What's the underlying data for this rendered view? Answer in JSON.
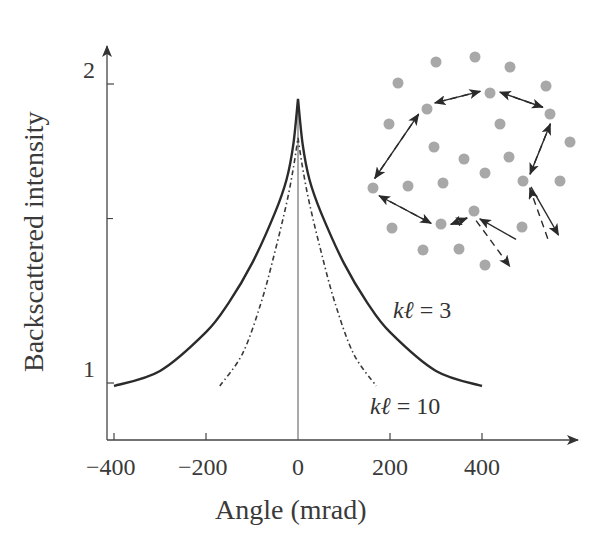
{
  "chart_data": {
    "type": "line",
    "title": "",
    "xlabel": "Angle (mrad)",
    "ylabel": "Backscattered intensity",
    "x_ticks": [
      "−400",
      "−200",
      "0",
      "200",
      "400"
    ],
    "x_tick_values": [
      -400,
      -200,
      0,
      200,
      400
    ],
    "y_ticks": [
      "1",
      "2"
    ],
    "y_tick_values": [
      1,
      2
    ],
    "y_minor_tick_values": [
      1.55
    ],
    "xlim": [
      -420,
      600
    ],
    "ylim": [
      0.8,
      2.15
    ],
    "grid": false,
    "legend_position": "inline labels",
    "series": [
      {
        "name": "kℓ = 3",
        "label_k": "kℓ",
        "label_value": "= 3",
        "style": "solid",
        "color": "#2b2b2b",
        "x": [
          -400,
          -300,
          -200,
          -150,
          -100,
          -50,
          -25,
          -10,
          0,
          10,
          25,
          50,
          100,
          150,
          200,
          300,
          400
        ],
        "y": [
          0.99,
          1.04,
          1.17,
          1.27,
          1.4,
          1.57,
          1.68,
          1.8,
          1.95,
          1.8,
          1.68,
          1.57,
          1.4,
          1.27,
          1.17,
          1.04,
          0.99
        ]
      },
      {
        "name": "kℓ = 10",
        "label_k": "kℓ",
        "label_value": "= 10",
        "style": "dash-dot",
        "color": "#3a3a3a",
        "x": [
          -170,
          -120,
          -80,
          -50,
          -25,
          -10,
          0,
          10,
          25,
          50,
          80,
          120,
          170
        ],
        "y": [
          0.99,
          1.1,
          1.27,
          1.44,
          1.6,
          1.72,
          1.82,
          1.72,
          1.6,
          1.44,
          1.27,
          1.1,
          0.99
        ]
      }
    ],
    "annotations": [
      {
        "text": "kℓ = 3",
        "near_x": 350,
        "near_y": 1.2
      },
      {
        "text": "kℓ = 10",
        "near_x": 300,
        "near_y": 0.92
      }
    ],
    "inset": {
      "description": "Random walk of light among scatterers: forward path (solid arrows) and time-reversed path (dashed arrows)",
      "scatterer_color": "#a8a8a8",
      "scatterers": [
        [
          436,
          62
        ],
        [
          475,
          57
        ],
        [
          510,
          67
        ],
        [
          398,
          83
        ],
        [
          546,
          86
        ],
        [
          490,
          93
        ],
        [
          427,
          109
        ],
        [
          550,
          114
        ],
        [
          389,
          124
        ],
        [
          500,
          124
        ],
        [
          570,
          142
        ],
        [
          434,
          147
        ],
        [
          464,
          159
        ],
        [
          509,
          157
        ],
        [
          485,
          173
        ],
        [
          523,
          181
        ],
        [
          560,
          181
        ],
        [
          373,
          188
        ],
        [
          408,
          186
        ],
        [
          443,
          183
        ],
        [
          474,
          211
        ],
        [
          441,
          224
        ],
        [
          392,
          228
        ],
        [
          522,
          227
        ],
        [
          423,
          250
        ],
        [
          459,
          249
        ],
        [
          485,
          265
        ]
      ],
      "forward_path": [
        [
          518,
          236
        ],
        [
          474,
          211
        ],
        [
          441,
          224
        ],
        [
          373,
          188
        ],
        [
          427,
          109
        ],
        [
          490,
          93
        ],
        [
          550,
          114
        ],
        [
          523,
          181
        ],
        [
          555,
          237
        ]
      ],
      "reverse_path": [
        [
          544,
          240
        ],
        [
          523,
          181
        ],
        [
          550,
          114
        ],
        [
          490,
          93
        ],
        [
          427,
          109
        ],
        [
          373,
          188
        ],
        [
          441,
          224
        ],
        [
          474,
          211
        ],
        [
          513,
          264
        ]
      ]
    }
  }
}
